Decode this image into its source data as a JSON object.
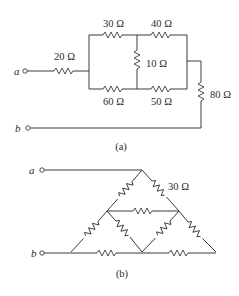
{
  "figure_a": {
    "caption": "(a)",
    "terminals": {
      "a": "a",
      "b": "b"
    },
    "resistors": {
      "r20": "20 Ω",
      "r30": "30 Ω",
      "r40": "40 Ω",
      "r10": "10 Ω",
      "r60": "60 Ω",
      "r50": "50 Ω",
      "r80": "80 Ω"
    }
  },
  "figure_b": {
    "caption": "(b)",
    "terminals": {
      "a": "a",
      "b": "b"
    },
    "resistors": {
      "labeled": "30 Ω",
      "count": 9
    },
    "note": "All nine resistors in the triangular lattice; one labeled 30 Ω"
  },
  "colors": {
    "line": "#3a3a3a",
    "text": "#2a2a2a",
    "background": "#ffffff"
  }
}
